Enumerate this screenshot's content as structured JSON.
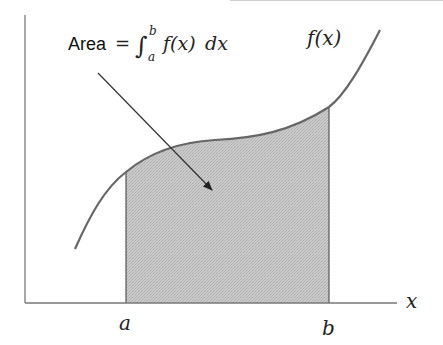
{
  "diagram": {
    "annotation": {
      "prefix": "Area",
      "equals": "=",
      "integral_sign": "∫",
      "upper_limit": "b",
      "lower_limit": "a",
      "integrand": "f(x)",
      "differential": "dx"
    },
    "curve_label": "f(x)",
    "axis_label_x": "x",
    "tick_labels": {
      "a": "a",
      "b": "b"
    },
    "colors": {
      "shade": "#c4c4c4",
      "curve": "#666666",
      "axes": "#555555",
      "arrow": "#333333"
    }
  }
}
